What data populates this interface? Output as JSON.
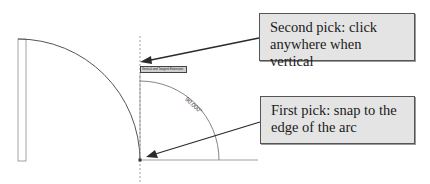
{
  "callouts": {
    "second_pick": "Second pick: click anywhere when vertical",
    "first_pick": "First pick: snap to the edge of the arc"
  },
  "drawing": {
    "snap_tooltip": "Vertical and Tangent Extension",
    "angle_dimension": "90.000°"
  },
  "colors": {
    "callout_fill": "#e4e4e4",
    "callout_border": "#555555",
    "arrow": "#2a2a2a",
    "geometry_line": "#555555",
    "guide_dash": "#777777"
  }
}
